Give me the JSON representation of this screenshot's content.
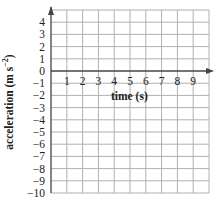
{
  "chart_data": {
    "type": "line",
    "title": "",
    "xlabel": "time (s)",
    "ylabel": "acceleration (m s⁻²)",
    "ylabel_parts": {
      "base": "acceleration (m s",
      "sup": "−2",
      "close": ")"
    },
    "x_ticks": [
      1,
      2,
      3,
      4,
      5,
      6,
      7,
      8,
      9
    ],
    "y_ticks": [
      4,
      3,
      2,
      1,
      0,
      -1,
      -2,
      -3,
      -4,
      -5,
      -6,
      -7,
      -8,
      -9,
      -10
    ],
    "y_tick_labels": [
      "4",
      "3",
      "2",
      "1",
      "0",
      "−1",
      "−2",
      "−3",
      "−4",
      "−5",
      "−6",
      "−7",
      "−8",
      "−9",
      "−10"
    ],
    "xlim": [
      0,
      10
    ],
    "ylim": [
      -10,
      5
    ],
    "grid": true,
    "series": [],
    "note": "Blank grid with axes; no data plotted"
  },
  "colors": {
    "grid": "#b0b0b0",
    "axis": "#444444",
    "text": "#222222"
  }
}
